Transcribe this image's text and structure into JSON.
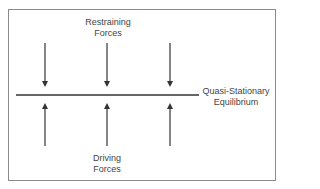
{
  "diagram": {
    "type": "force-field-analysis",
    "restraining_label": {
      "line1": "Restraining",
      "line2": "Forces"
    },
    "driving_label": {
      "line1": "Driving",
      "line2": "Forces"
    },
    "equilibrium_label": {
      "line1": "Quasi-Stationary",
      "line2": "Equilibrium"
    },
    "restraining_arrows": [
      {
        "x": 45,
        "direction": "down"
      },
      {
        "x": 107,
        "direction": "down"
      },
      {
        "x": 170,
        "direction": "down"
      }
    ],
    "driving_arrows": [
      {
        "x": 45,
        "direction": "up"
      },
      {
        "x": 107,
        "direction": "up"
      },
      {
        "x": 170,
        "direction": "up"
      }
    ],
    "colors": {
      "line": "#333333",
      "text": "#444444",
      "border": "#8a8a8a",
      "background": "#ffffff"
    }
  }
}
